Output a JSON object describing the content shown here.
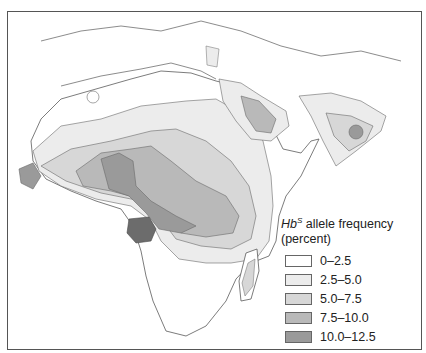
{
  "map": {
    "subject": "HbS allele frequency distribution",
    "regions_shown": [
      "Africa",
      "Middle East",
      "Indian subcontinent",
      "Southern Europe"
    ],
    "colors": {
      "border": "#5a5a5a",
      "water": "#ffffff"
    }
  },
  "legend": {
    "title_gene": "Hb",
    "title_sup": "S",
    "title_rest": " allele frequency",
    "title_line2": "(percent)",
    "items": [
      {
        "label": "0–2.5",
        "color": "#ffffff"
      },
      {
        "label": "2.5–5.0",
        "color": "#ececec"
      },
      {
        "label": "5.0–7.5",
        "color": "#d7d7d7"
      },
      {
        "label": "7.5–10.0",
        "color": "#b9b9b9"
      },
      {
        "label": "10.0–12.5",
        "color": "#9a9a9a"
      },
      {
        "label": "> 12.5",
        "color": "#6c6c6c"
      }
    ]
  }
}
